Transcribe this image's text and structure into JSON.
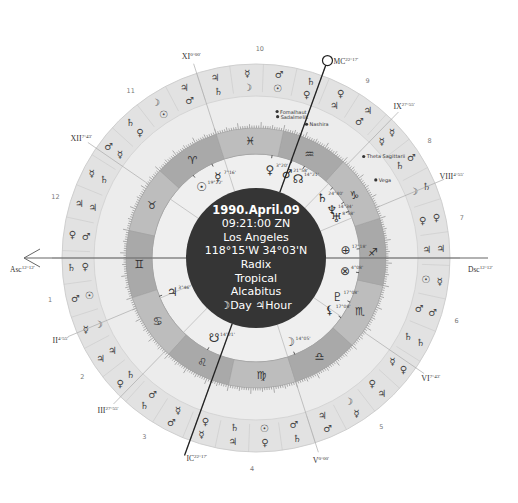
{
  "chart_info": {
    "date": "1990.April.09",
    "time": "09:21:00 ZN",
    "place": "Los Angeles",
    "coords": "118°15'W 34°03'N",
    "chart_type": "Radix",
    "zodiac": "Tropical",
    "house_system": "Alcabitus",
    "day_hour": "☽Day ♃Hour"
  },
  "colors": {
    "background": "#ffffff",
    "outer_ring": "#e2e2e2",
    "middle_ring": "#ececec",
    "zodiac_band_dark": "#a9a9a9",
    "zodiac_band_light": "#bdbdbd",
    "house_wheel": "#efefef",
    "center_disc": "#353535",
    "line": "#555555",
    "text": "#333333"
  },
  "geometry": {
    "cx": 256,
    "cy": 258,
    "r_outer": 194,
    "r_outer_inner": 162,
    "r_mid_inner": 130,
    "r_zodiac_inner": 104,
    "r_center": 70,
    "asc_longitude": 72.2
  },
  "zodiac_signs": [
    {
      "name": "Aries",
      "glyph": "♈"
    },
    {
      "name": "Taurus",
      "glyph": "♉"
    },
    {
      "name": "Gemini",
      "glyph": "♊"
    },
    {
      "name": "Cancer",
      "glyph": "♋"
    },
    {
      "name": "Leo",
      "glyph": "♌"
    },
    {
      "name": "Virgo",
      "glyph": "♍"
    },
    {
      "name": "Libra",
      "glyph": "♎"
    },
    {
      "name": "Scorpio",
      "glyph": "♏"
    },
    {
      "name": "Sagittarius",
      "glyph": "♐"
    },
    {
      "name": "Capricorn",
      "glyph": "♑"
    },
    {
      "name": "Aquarius",
      "glyph": "♒"
    },
    {
      "name": "Pisces",
      "glyph": "♓"
    }
  ],
  "angles": [
    {
      "name": "Asc",
      "label": "Asc",
      "deg": "12°12'",
      "longitude": 72.2
    },
    {
      "name": "Dsc",
      "label": "Dsc",
      "deg": "12°12'",
      "longitude": 252.2
    },
    {
      "name": "MC",
      "label": "MC",
      "deg": "22°17'",
      "longitude": 322.3
    },
    {
      "name": "IC",
      "label": "IC",
      "deg": "22°17'",
      "longitude": 142.3
    }
  ],
  "house_cusps": [
    {
      "num": "1",
      "roman": "Asc",
      "deg": "12°12'",
      "longitude": 72.2
    },
    {
      "num": "2",
      "roman": "II",
      "deg": "4°55'",
      "longitude": 94.9
    },
    {
      "num": "3",
      "roman": "III",
      "deg": "27°55'",
      "longitude": 117.9
    },
    {
      "num": "4",
      "roman": "IC",
      "deg": "22°17'",
      "longitude": 142.3
    },
    {
      "num": "5",
      "roman": "V",
      "deg": "0°00'",
      "longitude": 180.0
    },
    {
      "num": "6",
      "roman": "VI",
      "deg": "7°43'",
      "longitude": 217.7
    },
    {
      "num": "7",
      "roman": "Dsc",
      "deg": "12°12'",
      "longitude": 252.2
    },
    {
      "num": "8",
      "roman": "VIII",
      "deg": "4°55'",
      "longitude": 274.9
    },
    {
      "num": "9",
      "roman": "IX",
      "deg": "27°55'",
      "longitude": 297.9
    },
    {
      "num": "10",
      "roman": "MC",
      "deg": "22°17'",
      "longitude": 322.3
    },
    {
      "num": "11",
      "roman": "XI",
      "deg": "0°00'",
      "longitude": 0.0
    },
    {
      "num": "12",
      "roman": "XII",
      "deg": "7°43'",
      "longitude": 37.7
    }
  ],
  "planets": [
    {
      "name": "Sun",
      "glyph": "☉",
      "deg": "19°22'",
      "longitude": 19.4
    },
    {
      "name": "Mercury",
      "glyph": "☿",
      "deg": "7°16'",
      "longitude": 7.3
    },
    {
      "name": "Venus",
      "glyph": "♀",
      "deg": "3°20'",
      "longitude": 333.3
    },
    {
      "name": "Mars",
      "glyph": "♂",
      "deg": "21°58'",
      "longitude": 321.9
    },
    {
      "name": "North Node",
      "glyph": "☊",
      "deg": "14°21'",
      "longitude": 314.4
    },
    {
      "name": "Saturn",
      "glyph": "♄",
      "deg": "24°40'",
      "longitude": 294.7
    },
    {
      "name": "Neptune",
      "glyph": "♆",
      "deg": "14°34'",
      "longitude": 284.6
    },
    {
      "name": "Uranus",
      "glyph": "♅",
      "deg": "8°58'",
      "longitude": 279.0
    },
    {
      "name": "Part of Fortune",
      "glyph": "⊕",
      "deg": "17°18'",
      "longitude": 257.3
    },
    {
      "name": "Vertex",
      "glyph": "⊗",
      "deg": "4°08'",
      "longitude": 244.1
    },
    {
      "name": "Pluto",
      "glyph": "♇",
      "deg": "17°08'",
      "longitude": 227.1
    },
    {
      "name": "Lilith",
      "glyph": "⚸",
      "deg": "17°08'",
      "longitude": 217.1
    },
    {
      "name": "Moon",
      "glyph": "☽",
      "deg": "14°05'",
      "longitude": 184.1
    },
    {
      "name": "South Node",
      "glyph": "☋",
      "deg": "14°21'",
      "longitude": 134.4
    },
    {
      "name": "Jupiter",
      "glyph": "♃",
      "deg": "3°46'",
      "longitude": 93.8
    }
  ],
  "fixed_stars": [
    {
      "name": "Sadalmelik",
      "longitude": 333.5
    },
    {
      "name": "Fomalhaut",
      "longitude": 334.0
    },
    {
      "name": "Nashira",
      "longitude": 321.5
    },
    {
      "name": "Theta Sagittarii",
      "longitude": 295.5
    },
    {
      "name": "Vega",
      "longitude": 285.3
    }
  ],
  "outer_ring_glyphs": {
    "inner_row": [
      "♂",
      "☉",
      "♀",
      "☿",
      "♄",
      "♃",
      "♂",
      "♀",
      "☉",
      "☽",
      "♃",
      "♄",
      "♂",
      "☿",
      "♀",
      "♄",
      "☉",
      "♂",
      "♃",
      "☽",
      "♀",
      "☿",
      "♄",
      "♂",
      "☉",
      "♃",
      "♀",
      "☽",
      "♄",
      "☿",
      "♂",
      "♃",
      "♀",
      "☉",
      "☽",
      "♄"
    ],
    "outer_row": [
      "♃",
      "☽",
      "♄",
      "♂",
      "☿",
      "♃",
      "♀",
      "♄",
      "♂",
      "☿",
      "♃",
      "♀",
      "♄",
      "♂",
      "☿",
      "♃",
      "♀",
      "♄",
      "♂",
      "☿",
      "♃",
      "♀",
      "♄",
      "♂",
      "☿",
      "♃",
      "♀",
      "♄",
      "♂",
      "☿",
      "♃",
      "♀",
      "♄",
      "♂",
      "☿",
      "♃"
    ]
  }
}
